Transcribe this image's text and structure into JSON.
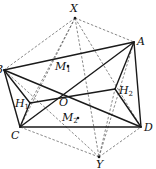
{
  "figure": {
    "width": 156,
    "height": 169,
    "colors": {
      "stroke": "#1a1a1a",
      "dashed": "#555555",
      "background": "#ffffff"
    },
    "points": {
      "X": {
        "x": 75,
        "y": 18
      },
      "A": {
        "x": 134,
        "y": 42
      },
      "B": {
        "x": 4,
        "y": 70
      },
      "C": {
        "x": 20,
        "y": 127
      },
      "D": {
        "x": 141,
        "y": 127
      },
      "Y": {
        "x": 99,
        "y": 157
      },
      "O": {
        "x": 64,
        "y": 93
      },
      "H1": {
        "x": 30,
        "y": 103
      },
      "H2": {
        "x": 115,
        "y": 89
      },
      "M1": {
        "x": 68,
        "y": 66
      },
      "M2": {
        "x": 78,
        "y": 118
      }
    },
    "labels": [
      {
        "id": "X",
        "text": "X",
        "sub": "",
        "x": 70,
        "y": 12
      },
      {
        "id": "A",
        "text": "A",
        "sub": "",
        "x": 137,
        "y": 45
      },
      {
        "id": "B",
        "text": "B",
        "sub": "",
        "x": -5,
        "y": 73
      },
      {
        "id": "C",
        "text": "C",
        "sub": "",
        "x": 11,
        "y": 139
      },
      {
        "id": "D",
        "text": "D",
        "sub": "",
        "x": 144,
        "y": 131
      },
      {
        "id": "Y",
        "text": "Y",
        "sub": "",
        "x": 96,
        "y": 168
      },
      {
        "id": "O",
        "text": "O",
        "sub": "",
        "x": 59,
        "y": 106
      },
      {
        "id": "H1",
        "text": "H",
        "sub": "1",
        "x": 15,
        "y": 107
      },
      {
        "id": "H2",
        "text": "H",
        "sub": "2",
        "x": 119,
        "y": 94
      },
      {
        "id": "M1",
        "text": "M",
        "sub": "1",
        "x": 55,
        "y": 70
      },
      {
        "id": "M2",
        "text": "M",
        "sub": "2",
        "x": 62,
        "y": 121
      }
    ],
    "solid_segments": [
      [
        "B",
        "A"
      ],
      [
        "A",
        "D"
      ],
      [
        "C",
        "D"
      ],
      [
        "B",
        "C"
      ],
      [
        "B",
        "D"
      ],
      [
        "A",
        "C"
      ],
      [
        "H1",
        "H2"
      ],
      [
        "B",
        "H1"
      ],
      [
        "A",
        "H2"
      ],
      [
        "C",
        "H1"
      ],
      [
        "D",
        "H2"
      ]
    ],
    "dashed_segments": [
      [
        "X",
        "B"
      ],
      [
        "X",
        "A"
      ],
      [
        "X",
        "C"
      ],
      [
        "X",
        "D"
      ],
      [
        "X",
        "Y"
      ],
      [
        "Y",
        "B"
      ],
      [
        "Y",
        "A"
      ],
      [
        "Y",
        "C"
      ],
      [
        "Y",
        "D"
      ],
      [
        "X",
        "H1"
      ],
      [
        "Y",
        "H2"
      ]
    ],
    "dots": [
      "M1",
      "M2",
      "X",
      "Y"
    ]
  }
}
